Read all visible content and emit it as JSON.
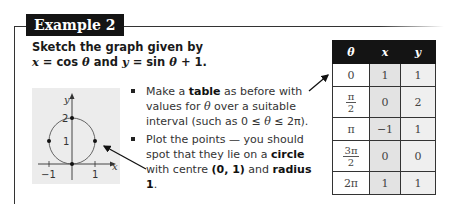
{
  "header": {
    "badge": "Example 2"
  },
  "prompt": {
    "line1": "Sketch the graph given by",
    "line2_parts": [
      "x",
      " = cos ",
      "θ",
      " and ",
      "y",
      " = sin ",
      "θ",
      " + 1."
    ]
  },
  "graph": {
    "y_axis_label": "y",
    "x_axis_label": "x",
    "y_ticks": [
      "2",
      "1"
    ],
    "x_ticks": [
      "−1",
      "1"
    ],
    "points": [
      [
        0,
        0
      ],
      [
        1,
        1
      ],
      [
        0,
        2
      ],
      [
        -1,
        1
      ]
    ],
    "circle": {
      "center": [
        0,
        1
      ],
      "radius": 1
    }
  },
  "bullets": [
    {
      "parts": [
        {
          "t": "Make a ",
          "b": false
        },
        {
          "t": "table",
          "b": true
        },
        {
          "t": " as before with values for ",
          "b": false
        },
        {
          "t": "θ",
          "i": true
        },
        {
          "t": " over a suitable interval (such as 0 ≤ ",
          "b": false
        },
        {
          "t": "θ",
          "i": true
        },
        {
          "t": " ≤ 2π).",
          "b": false
        }
      ]
    },
    {
      "parts": [
        {
          "t": "Plot the points — you should spot that they lie on a ",
          "b": false
        },
        {
          "t": "circle",
          "b": true
        },
        {
          "t": " with centre ",
          "b": false
        },
        {
          "t": "(0, 1)",
          "b": true
        },
        {
          "t": " and ",
          "b": false
        },
        {
          "t": "radius 1",
          "b": true
        },
        {
          "t": ".",
          "b": false
        }
      ]
    }
  ],
  "table": {
    "headers": [
      "θ",
      "x",
      "y"
    ],
    "rows": [
      {
        "theta": "0",
        "x": "1",
        "y": "1"
      },
      {
        "theta_num": "π",
        "theta_den": "2",
        "x": "0",
        "y": "2"
      },
      {
        "theta": "π",
        "x": "−1",
        "y": "1"
      },
      {
        "theta_num": "3π",
        "theta_den": "2",
        "x": "0",
        "y": "0"
      },
      {
        "theta": "2π",
        "x": "1",
        "y": "1"
      }
    ]
  }
}
